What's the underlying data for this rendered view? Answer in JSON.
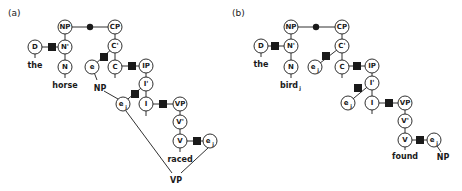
{
  "panels": [
    {
      "label": "(a)",
      "nodes": {
        "NP": "NP",
        "CP": "CP",
        "D": "D",
        "Nbar": "N'",
        "Cbar": "C'",
        "N": "N",
        "e": "e",
        "C": "C",
        "IP": "IP",
        "Ibar": "I'",
        "ej": "e",
        "ej_sub": "j",
        "I": "I",
        "VP": "VP",
        "Vbar": "V'",
        "V": "V",
        "ej2": "e",
        "ej2_sub": "j"
      },
      "words": {
        "the": "the",
        "horse": "horse",
        "raced": "raced",
        "np_label": "NP",
        "vp_label": "VP"
      }
    },
    {
      "label": "(b)",
      "nodes": {
        "NP": "NP",
        "CP": "CP",
        "D": "D",
        "Nbar": "N'",
        "Cbar": "C'",
        "N": "N",
        "ej": "e",
        "ej_sub": "j",
        "C": "C",
        "IP": "IP",
        "Ibar": "I'",
        "ej2": "e",
        "ej2_sub": "j",
        "I": "I",
        "VP": "VP",
        "Vbar": "V'",
        "V": "V",
        "ej3": "e",
        "ej3_sub": "j"
      },
      "words": {
        "the": "the",
        "bird": "bird",
        "bird_sub": "j",
        "found": "found",
        "np_label": "NP"
      }
    }
  ],
  "colors": {
    "ink": "#1a1a1a",
    "background": "#ffffff"
  }
}
